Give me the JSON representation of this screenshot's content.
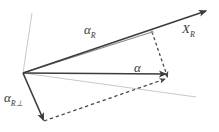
{
  "figure": {
    "title": "",
    "background_color": "#ffffff",
    "width": 219,
    "height": 132
  },
  "colors": {
    "dark_vector": "#3c3c3c",
    "mid_vector": "#8a8a8a",
    "light_axis": "#c8c8c8",
    "dashed": "#4a4a4a",
    "label_text": "#3a3a3a"
  },
  "labels": {
    "alpha_R": {
      "base": "α",
      "sub": "R",
      "x": 84,
      "y": 34
    },
    "X_R": {
      "base": "X",
      "sub": "R",
      "x": 182,
      "y": 33
    },
    "alpha": {
      "base": "α",
      "sub": "",
      "x": 134,
      "y": 72
    },
    "alpha_R_perp": {
      "base": "α",
      "sub": "R⊥",
      "x": 4,
      "y": 102
    }
  },
  "geometry": {
    "origin": {
      "x": 23,
      "y": 73
    },
    "vectors": [
      {
        "name": "alpha-R-vector",
        "from": {
          "x": 23,
          "y": 73
        },
        "to": {
          "x": 152,
          "y": 32
        },
        "style": "solid",
        "color": "#8a8a8a",
        "width": 1.1,
        "arrow": false
      },
      {
        "name": "X-R-axis-vector",
        "from": {
          "x": 23,
          "y": 73
        },
        "to": {
          "x": 207,
          "y": 11
        },
        "style": "solid",
        "color": "#3c3c3c",
        "width": 1.6,
        "arrow": true
      },
      {
        "name": "alpha-vector",
        "from": {
          "x": 23,
          "y": 73
        },
        "to": {
          "x": 167,
          "y": 74
        },
        "style": "solid",
        "color": "#3c3c3c",
        "width": 1.6,
        "arrow": true
      },
      {
        "name": "alpha-R-perp-vector",
        "from": {
          "x": 23,
          "y": 73
        },
        "to": {
          "x": 44,
          "y": 121
        },
        "style": "solid",
        "color": "#3c3c3c",
        "width": 1.6,
        "arrow": true
      },
      {
        "name": "projection-dashed-vertical",
        "from": {
          "x": 152,
          "y": 32
        },
        "to": {
          "x": 168,
          "y": 78
        },
        "style": "dashed",
        "color": "#4a4a4a",
        "width": 1.3,
        "arrow": true
      },
      {
        "name": "projection-dashed-diagonal",
        "from": {
          "x": 44,
          "y": 121
        },
        "to": {
          "x": 166,
          "y": 79
        },
        "style": "dashed",
        "color": "#4a4a4a",
        "width": 1.3,
        "arrow": true
      },
      {
        "name": "axis-line-upper-left",
        "from": {
          "x": 23,
          "y": 73
        },
        "to": {
          "x": 32,
          "y": 13
        },
        "style": "solid",
        "color": "#c8c8c8",
        "width": 1.0,
        "arrow": false
      },
      {
        "name": "axis-line-lower-right",
        "from": {
          "x": 23,
          "y": 73
        },
        "to": {
          "x": 196,
          "y": 97
        },
        "style": "solid",
        "color": "#c8c8c8",
        "width": 1.0,
        "arrow": false
      }
    ],
    "nodes": [
      {
        "name": "projection-point-on-alpha-R",
        "x": 152,
        "y": 32
      },
      {
        "name": "vector-head-cluster",
        "x": 167,
        "y": 75
      }
    ]
  }
}
